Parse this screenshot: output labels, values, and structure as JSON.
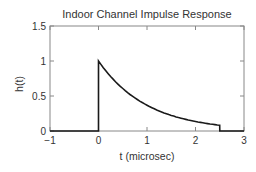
{
  "chart_data": {
    "type": "line",
    "title": "Indoor Channel Impulse Response",
    "xlabel": "t (microsec)",
    "ylabel": "h(t)",
    "xlim": [
      -1,
      3
    ],
    "ylim": [
      0,
      1.5
    ],
    "xticks": [
      -1,
      0,
      1,
      2,
      3
    ],
    "yticks": [
      0,
      0.5,
      1,
      1.5
    ],
    "grid": false,
    "legend": null,
    "series": [
      {
        "name": "h(t)",
        "description": "Zero for t<0, jumps to 1 at t=0, decays as exp(-t/1us), truncated to 0 at t=2.5",
        "x": [
          -1,
          0,
          0,
          0.25,
          0.5,
          0.75,
          1.0,
          1.25,
          1.5,
          1.75,
          2.0,
          2.25,
          2.5,
          2.5,
          3
        ],
        "y": [
          0,
          0,
          1.0,
          0.78,
          0.61,
          0.47,
          0.37,
          0.29,
          0.22,
          0.17,
          0.14,
          0.11,
          0.08,
          0,
          0
        ]
      }
    ],
    "color": "#1a1a1a",
    "axis_color": "#888888"
  }
}
